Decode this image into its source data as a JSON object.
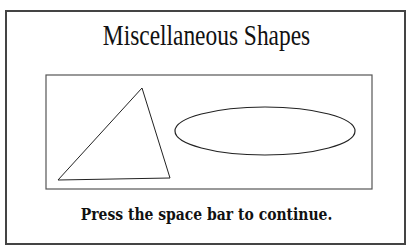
{
  "screen": {
    "title": "Miscellaneous Shapes",
    "prompt": "Press the space bar to continue."
  },
  "shapes": [
    {
      "type": "triangle",
      "points": [
        [
          58,
          180
        ],
        [
          142,
          88
        ],
        [
          170,
          178
        ]
      ]
    },
    {
      "type": "ellipse",
      "cx": 265,
      "cy": 131,
      "rx": 90,
      "ry": 24
    }
  ],
  "colors": {
    "background": "#ffffff",
    "stroke": "#222222",
    "frame": "#444444"
  }
}
